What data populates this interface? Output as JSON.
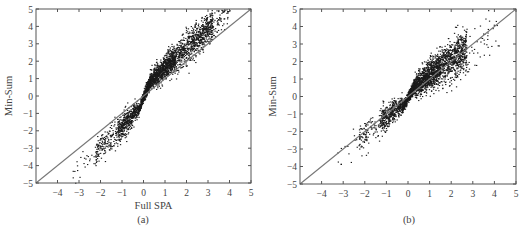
{
  "chart_data": [
    {
      "panel": "a",
      "type": "scatter",
      "title": "",
      "caption": "(a)",
      "xlabel": "Full SPA",
      "ylabel": "Min-Sum",
      "xlim": [
        -5,
        5
      ],
      "ylim": [
        -5,
        5
      ],
      "xticks": [
        -4,
        -3,
        -2,
        -1,
        0,
        1,
        2,
        3,
        4,
        5
      ],
      "yticks": [
        -5,
        -4,
        -3,
        -2,
        -1,
        0,
        1,
        2,
        3,
        4,
        5
      ],
      "grid": false,
      "legend": null,
      "reference_line": {
        "name": "y = x",
        "from": [
          -5,
          -5
        ],
        "to": [
          5,
          5
        ]
      },
      "series": [
        {
          "name": "LLR pairs (Full SPA vs Min-Sum)",
          "description": "Dense cloud lying above the y=x line for positive values and below it for negative values (min-sum overestimates magnitude); pinched near origin",
          "clusters": [
            {
              "x_range": [
                0.0,
                0.3
              ],
              "slope": 3.0,
              "offset": 0.0,
              "spread": 0.25,
              "count": 380
            },
            {
              "x_range": [
                0.3,
                1.5
              ],
              "slope": 1.15,
              "offset": 0.55,
              "spread": 0.35,
              "count": 900
            },
            {
              "x_range": [
                1.5,
                3.2
              ],
              "slope": 1.1,
              "offset": 0.6,
              "spread": 0.45,
              "count": 700
            },
            {
              "x_range": [
                3.2,
                4.0
              ],
              "slope": 1.0,
              "offset": 0.9,
              "spread": 0.45,
              "count": 60
            },
            {
              "x_range": [
                -0.3,
                0.0
              ],
              "slope": 3.0,
              "offset": 0.0,
              "spread": 0.2,
              "count": 200
            },
            {
              "x_range": [
                -1.2,
                -0.3
              ],
              "slope": 1.35,
              "offset": -0.35,
              "spread": 0.35,
              "count": 420
            },
            {
              "x_range": [
                -2.3,
                -1.2
              ],
              "slope": 1.2,
              "offset": -0.5,
              "spread": 0.4,
              "count": 180
            },
            {
              "x_range": [
                -3.3,
                -2.3
              ],
              "slope": 1.1,
              "offset": -0.7,
              "spread": 0.35,
              "count": 22
            }
          ]
        }
      ]
    },
    {
      "panel": "b",
      "type": "scatter",
      "title": "",
      "caption": "(b)",
      "xlabel": "",
      "ylabel": "Min-Sum",
      "xlim": [
        -5,
        5
      ],
      "ylim": [
        -5,
        5
      ],
      "xticks": [
        -4,
        -3,
        -2,
        -1,
        0,
        1,
        2,
        3,
        4,
        5
      ],
      "yticks": [
        -5,
        -4,
        -3,
        -2,
        -1,
        0,
        1,
        2,
        3,
        4,
        5
      ],
      "grid": false,
      "legend": null,
      "reference_line": {
        "name": "y = x",
        "from": [
          -5,
          -5
        ],
        "to": [
          5,
          5
        ]
      },
      "series": [
        {
          "name": "LLR pairs (corrected Min-Sum)",
          "description": "Cloud centered on the y=x line with wider spread; pinched near origin; sparse outliers up to x~4.2",
          "clusters": [
            {
              "x_range": [
                0.0,
                0.3
              ],
              "slope": 2.2,
              "offset": 0.0,
              "spread": 0.25,
              "count": 350
            },
            {
              "x_range": [
                0.3,
                1.5
              ],
              "slope": 0.95,
              "offset": 0.3,
              "spread": 0.45,
              "count": 950
            },
            {
              "x_range": [
                1.5,
                2.7
              ],
              "slope": 0.9,
              "offset": 0.3,
              "spread": 0.6,
              "count": 650
            },
            {
              "x_range": [
                2.7,
                4.2
              ],
              "slope": 0.85,
              "offset": 0.3,
              "spread": 0.7,
              "count": 45
            },
            {
              "x_range": [
                -0.3,
                0.0
              ],
              "slope": 2.2,
              "offset": 0.0,
              "spread": 0.2,
              "count": 200
            },
            {
              "x_range": [
                -1.3,
                -0.3
              ],
              "slope": 0.9,
              "offset": -0.2,
              "spread": 0.35,
              "count": 400
            },
            {
              "x_range": [
                -2.3,
                -1.3
              ],
              "slope": 0.95,
              "offset": -0.2,
              "spread": 0.4,
              "count": 110
            },
            {
              "x_range": [
                -3.3,
                -2.3
              ],
              "slope": 0.9,
              "offset": -0.4,
              "spread": 0.5,
              "count": 14
            }
          ]
        }
      ]
    }
  ],
  "style": {
    "axis_color": "#555555",
    "point_color": "#1a1a1a",
    "reference_line_color": "#777777"
  }
}
